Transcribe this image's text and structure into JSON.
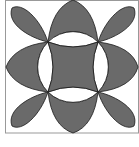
{
  "diagram": {
    "type": "geometric-pattern",
    "colors": {
      "fill": "#6a6a6a",
      "stroke": "#1a1a1a",
      "background": "#ffffff",
      "frame": "#999999"
    },
    "center": [
      73,
      67
    ],
    "circle_radius": 35.4,
    "inner_square_corners": [
      [
        48,
        42
      ],
      [
        98,
        42
      ],
      [
        98,
        92
      ],
      [
        48,
        92
      ]
    ],
    "frame": {
      "left": 5,
      "top": 0,
      "right": 139,
      "bottom": 133
    }
  }
}
